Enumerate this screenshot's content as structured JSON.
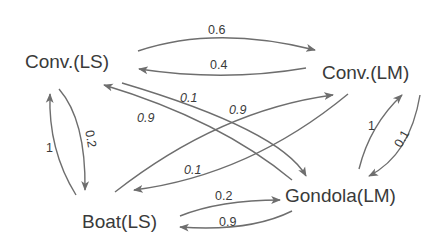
{
  "diagram": {
    "type": "state-transition-graph",
    "nodes": [
      {
        "id": "conv_ls",
        "label": "Conv.(LS)"
      },
      {
        "id": "conv_lm",
        "label": "Conv.(LM)"
      },
      {
        "id": "boat_ls",
        "label": "Boat(LS)"
      },
      {
        "id": "gondola_lm",
        "label": "Gondola(LM)"
      }
    ],
    "edges": [
      {
        "from": "conv_ls",
        "to": "conv_lm",
        "label": "0.6"
      },
      {
        "from": "conv_lm",
        "to": "conv_ls",
        "label": "0.4"
      },
      {
        "from": "conv_ls",
        "to": "gondola_lm",
        "label": "0.1"
      },
      {
        "from": "gondola_lm",
        "to": "conv_ls",
        "label": "0.9"
      },
      {
        "from": "boat_ls",
        "to": "conv_lm",
        "label": "0.9"
      },
      {
        "from": "conv_lm",
        "to": "boat_ls",
        "label": "0.1"
      },
      {
        "from": "boat_ls",
        "to": "conv_ls",
        "label": "1"
      },
      {
        "from": "conv_ls",
        "to": "boat_ls",
        "label": "0.2"
      },
      {
        "from": "gondola_lm",
        "to": "conv_lm",
        "label": "1"
      },
      {
        "from": "conv_lm",
        "to": "gondola_lm",
        "label": "0.1"
      },
      {
        "from": "boat_ls",
        "to": "gondola_lm",
        "label": "0.2"
      },
      {
        "from": "gondola_lm",
        "to": "boat_ls",
        "label": "0.9"
      }
    ]
  },
  "colors": {
    "edge": "#6e6e6e",
    "text": "#3a3a3a",
    "background": "#ffffff"
  }
}
